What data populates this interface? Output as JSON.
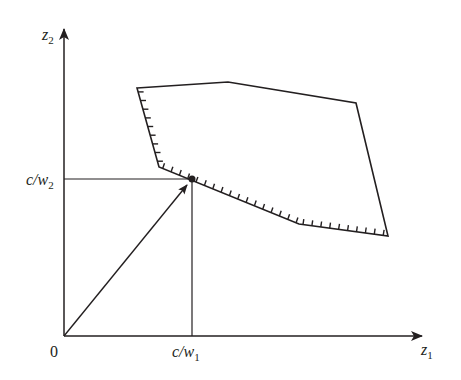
{
  "diagram": {
    "type": "feasible-region-weighted-sum",
    "stroke_color": "#231f20",
    "background": "#ffffff",
    "axes": {
      "origin_label": "0",
      "x_label": {
        "base": "z",
        "sub": "1"
      },
      "y_label": {
        "base": "z",
        "sub": "2"
      }
    },
    "tick_labels": {
      "x": {
        "base": "c/w",
        "sub": "1"
      },
      "y": {
        "base": "c/w",
        "sub": "2"
      }
    },
    "region": {
      "vertices": [
        [
          137,
          88
        ],
        [
          228,
          82
        ],
        [
          356,
          103
        ],
        [
          388,
          236
        ],
        [
          299,
          224
        ],
        [
          159,
          167
        ]
      ],
      "hatched_edges": [
        "left",
        "lower-left",
        "lower-right"
      ]
    },
    "point": {
      "x": 192,
      "y": 179,
      "label": ""
    },
    "vector": {
      "from": "origin",
      "to": "tangent point"
    }
  }
}
